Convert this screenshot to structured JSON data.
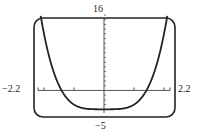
{
  "chart_data": {
    "type": "line",
    "title": "",
    "xlabel": "",
    "ylabel": "",
    "xlim": [
      -2.2,
      2.2
    ],
    "ylim": [
      -5,
      16
    ],
    "grid": false,
    "legend": null,
    "window_labels": {
      "ymax": "16",
      "ymin": "−5",
      "xmin": "−2.2",
      "xmax": "2.2"
    },
    "x_ticks": [
      -2,
      -1,
      0,
      1,
      2
    ],
    "y_ticks": [
      -4,
      -3,
      -2,
      -1,
      1,
      2,
      3,
      4,
      5,
      6,
      7,
      8,
      9,
      10,
      11,
      12,
      13,
      14,
      15,
      16
    ],
    "series": [
      {
        "name": "f(x)",
        "approx_function": "y = x^4 - 4",
        "x": [
          -2.11,
          -2.0,
          -1.75,
          -1.5,
          -1.25,
          -1.0,
          -0.75,
          -0.5,
          -0.25,
          0.0,
          0.25,
          0.5,
          0.75,
          1.0,
          1.25,
          1.5,
          1.75,
          2.0,
          2.11
        ],
        "y": [
          16.0,
          12.0,
          5.38,
          1.06,
          -1.56,
          -3.0,
          -3.68,
          -3.94,
          -4.0,
          -4.0,
          -4.0,
          -3.94,
          -3.68,
          -3.0,
          -1.56,
          1.06,
          5.38,
          12.0,
          16.0
        ]
      }
    ],
    "colors": {
      "curve": "#222222",
      "axes": "#555555",
      "frame": "#222222"
    }
  }
}
